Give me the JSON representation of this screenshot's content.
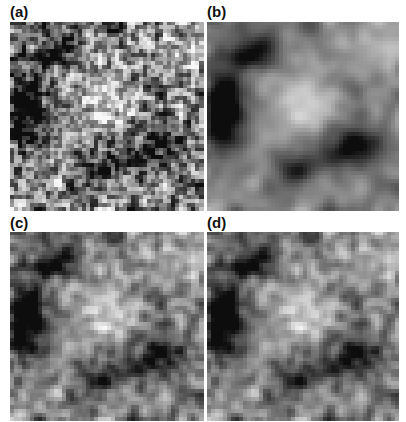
{
  "figure": {
    "panels": [
      {
        "label": "(a)",
        "description": "fine-grained grayscale noise field",
        "smooth": 1.0,
        "seed": 11
      },
      {
        "label": "(b)",
        "description": "smoothed grayscale noise field with large dark regions",
        "smooth": 2.4,
        "seed": 11
      },
      {
        "label": "(c)",
        "description": "grayscale noise field, intermediate",
        "smooth": 1.5,
        "seed": 11
      },
      {
        "label": "(d)",
        "description": "grayscale noise field, intermediate",
        "smooth": 1.6,
        "seed": 11
      }
    ],
    "grid_cells": 48,
    "colors": {
      "background": "#ffffff",
      "label": "#111111"
    }
  }
}
